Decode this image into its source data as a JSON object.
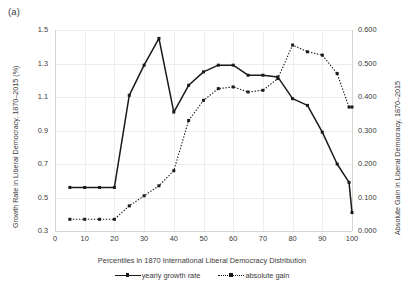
{
  "panel": {
    "label": "(a)"
  },
  "chart_data": {
    "type": "line",
    "title": "",
    "panel_label": "(a)",
    "xlabel": "Percentiles in 1870 International Liberal Democracy Distribution",
    "ylabel": "Growth Rate in Liberal Democracy, 1870–2015 (%)",
    "y2label": "Absolute Gain in Liberal Democracy, 1870–2015",
    "x": [
      5,
      10,
      15,
      20,
      25,
      30,
      35,
      40,
      45,
      50,
      55,
      60,
      65,
      70,
      75,
      80,
      85,
      90,
      95,
      99,
      100
    ],
    "xlim": [
      0,
      100
    ],
    "xticks": [
      0,
      10,
      20,
      30,
      40,
      50,
      60,
      70,
      80,
      90,
      100
    ],
    "ylim": [
      0.3,
      1.5
    ],
    "yticks": [
      0.3,
      0.5,
      0.7,
      0.9,
      1.1,
      1.3,
      1.5
    ],
    "ytick_labels": [
      "0.3",
      "0.5",
      "0.7",
      "0.9",
      "1.1",
      "1.3",
      "1.5"
    ],
    "y2lim": [
      0.0,
      0.6
    ],
    "y2ticks": [
      0.0,
      0.1,
      0.2,
      0.3,
      0.4,
      0.5,
      0.6
    ],
    "y2tick_labels": [
      "0.000",
      "0.100",
      "0.200",
      "0.300",
      "0.400",
      "0.500",
      "0.600"
    ],
    "grid": true,
    "legend_position": "bottom",
    "series": [
      {
        "name": "yearly growth rate",
        "axis": "left",
        "style": "solid",
        "marker": "square",
        "color": "#1a1a1a",
        "values": [
          0.56,
          0.56,
          0.56,
          0.56,
          1.11,
          1.29,
          1.45,
          1.01,
          1.17,
          1.25,
          1.29,
          1.29,
          1.23,
          1.23,
          1.22,
          1.09,
          1.05,
          0.89,
          0.7,
          0.59,
          0.41
        ]
      },
      {
        "name": "absolute gain",
        "axis": "right",
        "style": "dotted",
        "marker": "square",
        "color": "#1a1a1a",
        "values": [
          0.035,
          0.035,
          0.035,
          0.035,
          0.075,
          0.105,
          0.135,
          0.18,
          0.33,
          0.39,
          0.425,
          0.43,
          0.415,
          0.42,
          0.455,
          0.555,
          0.535,
          0.525,
          0.47,
          0.37,
          0.37
        ]
      }
    ]
  },
  "legend": {
    "items": [
      {
        "label": "yearly growth rate",
        "style": "solid"
      },
      {
        "label": "absolute gain",
        "style": "dotted"
      }
    ]
  }
}
